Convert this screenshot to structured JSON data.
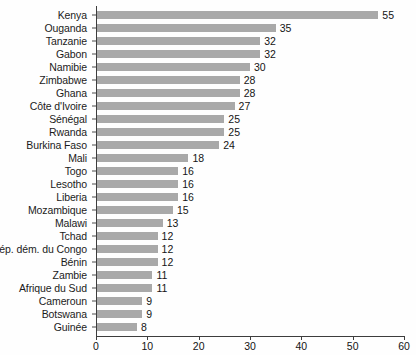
{
  "chart_data": {
    "type": "bar",
    "orientation": "horizontal",
    "title": "",
    "subtitle": "",
    "xlabel": "",
    "ylabel": "",
    "xlim": [
      0,
      60
    ],
    "xticks": [
      0,
      10,
      20,
      30,
      40,
      50,
      60
    ],
    "grid": false,
    "legend": null,
    "bar_color": "#a9a9a9",
    "axis_color": "#3d3d3d",
    "text_color": "#141414",
    "background": "#fefefe",
    "categories": [
      "Kenya",
      "Ouganda",
      "Tanzanie",
      "Gabon",
      "Namibie",
      "Zimbabwe",
      "Ghana",
      "Côte d'Ivoire",
      "Sénégal",
      "Rwanda",
      "Burkina Faso",
      "Mali",
      "Togo",
      "Lesotho",
      "Liberia",
      "Mozambique",
      "Malawi",
      "Tchad",
      "Rép. dém. du Congo",
      "Bénin",
      "Zambie",
      "Afrique du Sud",
      "Cameroun",
      "Botswana",
      "Guinée"
    ],
    "values": [
      55,
      35,
      32,
      32,
      30,
      28,
      28,
      27,
      25,
      25,
      24,
      18,
      16,
      16,
      16,
      15,
      13,
      12,
      12,
      12,
      11,
      11,
      9,
      9,
      8
    ],
    "value_labels": [
      "55",
      "35",
      "32",
      "32",
      "30",
      "28",
      "28",
      "27",
      "25",
      "25",
      "24",
      "18",
      "16",
      "16",
      "16",
      "15",
      "13",
      "12",
      "12",
      "12",
      "11",
      "11",
      "9",
      "9",
      "8"
    ],
    "xtick_labels": [
      "0",
      "10",
      "20",
      "30",
      "40",
      "50",
      "60"
    ]
  }
}
